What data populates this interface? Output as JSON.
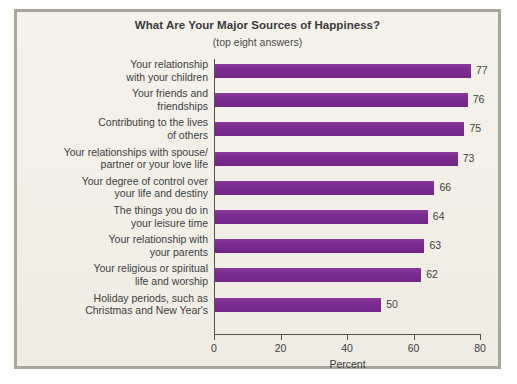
{
  "chart_data": {
    "type": "bar",
    "orientation": "horizontal",
    "title": "What Are Your Major Sources of Happiness?",
    "subtitle": "(top eight answers)",
    "xlabel": "Percent",
    "ylabel": "",
    "xlim": [
      0,
      80
    ],
    "xticks": [
      0,
      20,
      40,
      60,
      80
    ],
    "xtick_labels": [
      "0",
      "20",
      "40",
      "60",
      "80"
    ],
    "grid": false,
    "legend": false,
    "bar_color": "#7b2d8e",
    "background_color": "#f3f1e9",
    "categories": [
      "Your relationship\nwith your children",
      "Your friends and\nfriendships",
      "Contributing to the lives\nof others",
      "Your relationships with spouse/\npartner or your love life",
      "Your degree of control over\nyour life and destiny",
      "The things you do in\nyour leisure time",
      "Your relationship with\nyour parents",
      "Your religious or spiritual\nlife and worship",
      "Holiday periods, such as\nChristmas and New Year's"
    ],
    "values": [
      77,
      76,
      75,
      73,
      66,
      64,
      63,
      62,
      50
    ],
    "value_labels": [
      "77",
      "76",
      "75",
      "73",
      "66",
      "64",
      "63",
      "62",
      "50"
    ]
  }
}
